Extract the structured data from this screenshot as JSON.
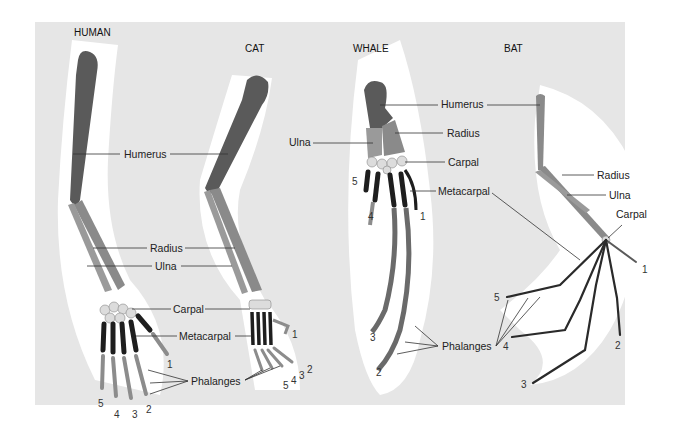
{
  "figure": {
    "colors": {
      "background_panel": "#e6e6e6",
      "halo": "#ffffff",
      "humerus": "#5a5a5a",
      "radius_ulna": "#8a8a8a",
      "carpal": "#dcdcdc",
      "metacarpal": "#1e1e1e",
      "phalanges": "#8c8c8c",
      "text": "#222222"
    },
    "panels": [
      {
        "title": "HUMAN",
        "labels": [
          "Humerus",
          "Radius",
          "Ulna",
          "Carpal",
          "Metacarpal",
          "Phalanges"
        ],
        "digit_numbers": [
          "1",
          "2",
          "3",
          "4",
          "5"
        ]
      },
      {
        "title": "CAT",
        "labels": [
          "Humerus",
          "Radius",
          "Ulna",
          "Carpal",
          "Metacarpal",
          "Phalanges"
        ],
        "digit_numbers": [
          "1",
          "2",
          "3",
          "4",
          "5"
        ]
      },
      {
        "title": "WHALE",
        "labels": [
          "Humerus",
          "Radius",
          "Ulna",
          "Carpal",
          "Metacarpal",
          "Phalanges"
        ],
        "digit_numbers": [
          "1",
          "2",
          "3",
          "4",
          "5"
        ]
      },
      {
        "title": "BAT",
        "labels": [
          "Humerus",
          "Radius",
          "Ulna",
          "Carpal",
          "Metacarpal",
          "Phalanges"
        ],
        "digit_numbers": [
          "1",
          "2",
          "3",
          "4",
          "5"
        ]
      }
    ]
  },
  "titles": {
    "human": "HUMAN",
    "cat": "CAT",
    "whale": "WHALE",
    "bat": "BAT"
  },
  "labels": {
    "humerus": "Humerus",
    "radius": "Radius",
    "ulna": "Ulna",
    "carpal": "Carpal",
    "metacarpal": "Metacarpal",
    "phalanges": "Phalanges"
  },
  "digits": {
    "d1": "1",
    "d2": "2",
    "d3": "3",
    "d4": "4",
    "d5": "5"
  }
}
